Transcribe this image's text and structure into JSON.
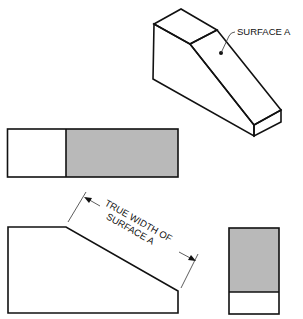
{
  "colors": {
    "line": "#111111",
    "surface_fill": "#b9b9b9",
    "background": "#ffffff"
  },
  "isometric_view": {
    "callout_label": "SURFACE A"
  },
  "top_view": {
    "description": "rectangle with shaded right portion"
  },
  "front_view": {
    "dimension_label_line1": "TRUE WIDTH OF",
    "dimension_label_line2": "SURFACE A"
  },
  "side_view": {
    "description": "rectangle with shaded upper portion"
  }
}
